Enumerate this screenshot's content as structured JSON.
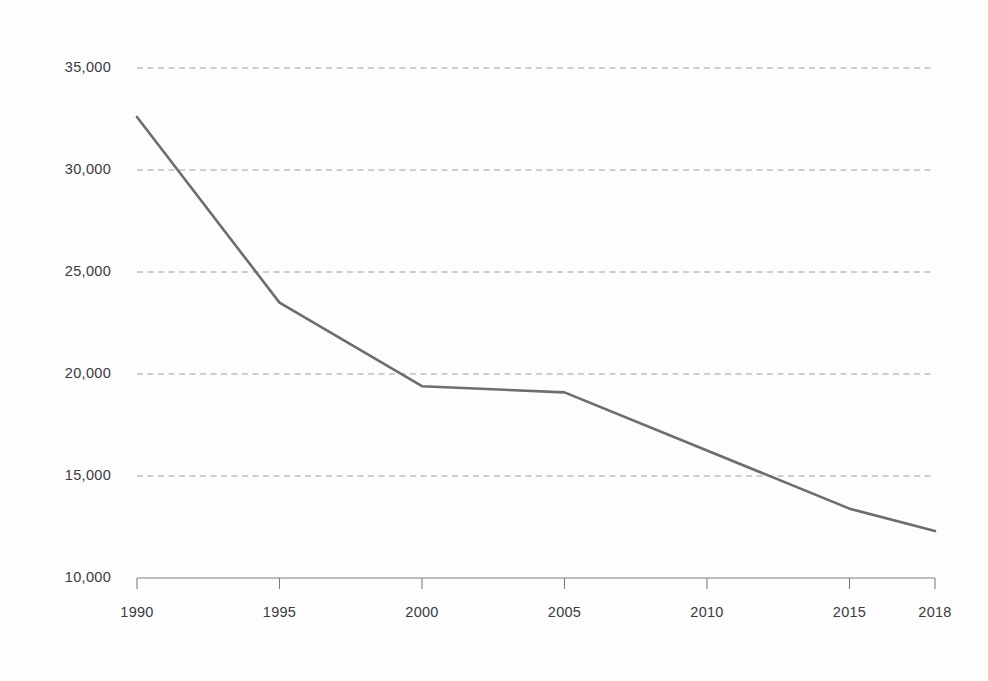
{
  "chart_data": {
    "type": "line",
    "title": "",
    "subtitle": "",
    "xlabel": "",
    "ylabel": "",
    "x": [
      1990,
      1995,
      2000,
      2005,
      2010,
      2015,
      2018
    ],
    "categories": [
      "1990",
      "1995",
      "2000",
      "2005",
      "2010",
      "2015",
      "2018"
    ],
    "values": [
      32600,
      23500,
      19400,
      19100,
      16250,
      13400,
      12300
    ],
    "series": [
      {
        "name": "",
        "values": [
          32600,
          23500,
          19400,
          19100,
          16250,
          13400,
          12300
        ],
        "color": "#6a6e73"
      }
    ],
    "xlim": [
      1990,
      2018
    ],
    "ylim": [
      10000,
      35000
    ],
    "xticks": [
      1990,
      1995,
      2000,
      2005,
      2010,
      2015,
      2018
    ],
    "xtick_labels": [
      "1990",
      "1995",
      "2000",
      "2005",
      "2010",
      "2015",
      "2018"
    ],
    "yticks": [
      10000,
      15000,
      20000,
      25000,
      30000,
      35000
    ],
    "ytick_labels": [
      "10,000",
      "15,000",
      "20,000",
      "25,000",
      "30,000",
      "35,000"
    ],
    "grid": "horizontal-dashed",
    "legend": "none",
    "annotations": [],
    "colors": {
      "background": "#fdfdfd",
      "line": "#6a6e73",
      "gridline": "#9aa0a6",
      "axis": "#7d7f84",
      "tick_label": "#3a3a3f"
    }
  }
}
